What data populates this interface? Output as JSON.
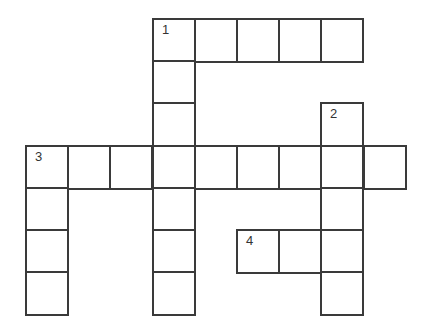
{
  "puzzle": {
    "type": "crossword",
    "rows": 7,
    "cols": 9,
    "cell_size": 42.2,
    "origin": {
      "x": 26,
      "y": 19
    },
    "border_color": "#3a3a3a",
    "cells": [
      {
        "r": 0,
        "c": 3,
        "num": "1"
      },
      {
        "r": 0,
        "c": 4
      },
      {
        "r": 0,
        "c": 5
      },
      {
        "r": 0,
        "c": 6
      },
      {
        "r": 0,
        "c": 7
      },
      {
        "r": 1,
        "c": 3
      },
      {
        "r": 2,
        "c": 3
      },
      {
        "r": 2,
        "c": 7,
        "num": "2"
      },
      {
        "r": 3,
        "c": 0,
        "num": "3"
      },
      {
        "r": 3,
        "c": 1
      },
      {
        "r": 3,
        "c": 2
      },
      {
        "r": 3,
        "c": 3
      },
      {
        "r": 3,
        "c": 4
      },
      {
        "r": 3,
        "c": 5
      },
      {
        "r": 3,
        "c": 6
      },
      {
        "r": 3,
        "c": 7
      },
      {
        "r": 3,
        "c": 8
      },
      {
        "r": 4,
        "c": 0
      },
      {
        "r": 4,
        "c": 3
      },
      {
        "r": 4,
        "c": 7
      },
      {
        "r": 5,
        "c": 0
      },
      {
        "r": 5,
        "c": 3
      },
      {
        "r": 5,
        "c": 5,
        "num": "4"
      },
      {
        "r": 5,
        "c": 6
      },
      {
        "r": 5,
        "c": 7
      },
      {
        "r": 6,
        "c": 0
      },
      {
        "r": 6,
        "c": 3
      },
      {
        "r": 6,
        "c": 7
      }
    ],
    "entries": [
      {
        "number": "1",
        "direction": "across",
        "row": 0,
        "col": 3,
        "length": 5
      },
      {
        "number": "1",
        "direction": "down",
        "row": 0,
        "col": 3,
        "length": 7
      },
      {
        "number": "2",
        "direction": "down",
        "row": 2,
        "col": 7,
        "length": 5
      },
      {
        "number": "3",
        "direction": "across",
        "row": 3,
        "col": 0,
        "length": 9
      },
      {
        "number": "3",
        "direction": "down",
        "row": 3,
        "col": 0,
        "length": 4
      },
      {
        "number": "4",
        "direction": "across",
        "row": 5,
        "col": 5,
        "length": 3
      }
    ]
  }
}
